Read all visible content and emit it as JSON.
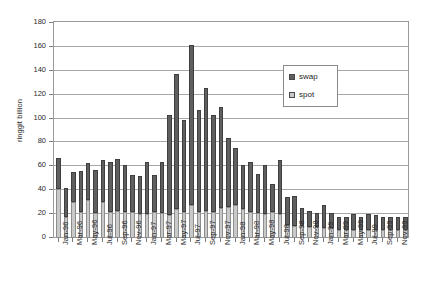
{
  "chart_data": {
    "type": "bar",
    "title": "",
    "subtitle": "",
    "xlabel": "",
    "ylabel": "ringgit billion",
    "ylim": [
      0,
      180
    ],
    "ystep": 20,
    "ytick_labels": [
      "0",
      "20",
      "40",
      "60",
      "80",
      "100",
      "120",
      "140",
      "160",
      "180"
    ],
    "grid": true,
    "stacked": true,
    "legend_position": "inside-upper-right",
    "legend": [
      "swap",
      "spot"
    ],
    "colors": {
      "swap": "#5f5f5f",
      "spot": "#c9c9c9",
      "axis": "#9a9a9a",
      "grid": "#a8a8a8"
    },
    "categories": [
      "Jan-96",
      "Feb-96",
      "Mar-96",
      "Apr-96",
      "May-96",
      "Jun-96",
      "Jul-96",
      "Aug-96",
      "Sep-96",
      "Oct-96",
      "Nov-96",
      "Dec-96",
      "Jan-97",
      "Feb-97",
      "Mar-97",
      "Apr-97",
      "May-97",
      "Jun-97",
      "Jul-97",
      "Aug-97",
      "Sep-97",
      "Oct-97",
      "Nov-97",
      "Dec-97",
      "Jan-98",
      "Feb-98",
      "Mar-98",
      "Apr-98",
      "May-98",
      "Jun-98",
      "Jul-98",
      "Aug-98",
      "Sep-98",
      "Oct-98",
      "Nov-98",
      "Dec-98",
      "Jan-99",
      "Feb-99",
      "Mar-99",
      "Apr-99",
      "May-99",
      "Jun-99",
      "Jul-99",
      "Aug-99",
      "Sep-99",
      "Oct-99",
      "Nov-99",
      "Dec-99"
    ],
    "xtick_labels": [
      "Jan-96",
      "Mar-96",
      "May-96",
      "Jul-96",
      "Sep-96",
      "Nov-96",
      "Jan-97",
      "Mar-97",
      "May-97",
      "Jul-97",
      "Sep-97",
      "Nov-97",
      "Jan-98",
      "Mar-98",
      "May-98",
      "Jul-98",
      "Sep-98",
      "Nov-98",
      "Jan-99",
      "Mar-99",
      "May-99",
      "Jul-99",
      "Sep-99",
      "Nov-99"
    ],
    "xtick_indices": [
      0,
      2,
      4,
      6,
      8,
      10,
      12,
      14,
      16,
      18,
      20,
      22,
      24,
      26,
      28,
      30,
      32,
      34,
      36,
      38,
      40,
      42,
      44,
      46
    ],
    "series": [
      {
        "name": "spot",
        "values": [
          41,
          18,
          30,
          22,
          32,
          21,
          30,
          22,
          23,
          22,
          22,
          20,
          20,
          22,
          21,
          19,
          24,
          22,
          28,
          22,
          23,
          22,
          25,
          26,
          28,
          24,
          22,
          21,
          20,
          22,
          20,
          11,
          10,
          10,
          9,
          9,
          8,
          8,
          7,
          7,
          7,
          7,
          7,
          7,
          7,
          7,
          7,
          7
        ]
      },
      {
        "name": "swap",
        "values": [
          26,
          24,
          25,
          34,
          31,
          36,
          35,
          42,
          43,
          39,
          31,
          32,
          44,
          31,
          43,
          84,
          113,
          77,
          134,
          85,
          103,
          81,
          85,
          58,
          47,
          37,
          42,
          33,
          41,
          23,
          45,
          23,
          25,
          15,
          14,
          12,
          20,
          13,
          11,
          11,
          13,
          11,
          13,
          12,
          11,
          11,
          11,
          11
        ]
      }
    ],
    "totals": [
      67,
      42,
      55,
      56,
      63,
      57,
      65,
      64,
      66,
      61,
      53,
      52,
      64,
      53,
      64,
      103,
      137,
      99,
      162,
      107,
      126,
      103,
      110,
      84,
      75,
      61,
      64,
      54,
      61,
      45,
      65,
      34,
      35,
      25,
      23,
      21,
      28,
      21,
      18,
      18,
      20,
      18,
      20,
      19,
      18,
      18,
      18,
      18
    ]
  }
}
